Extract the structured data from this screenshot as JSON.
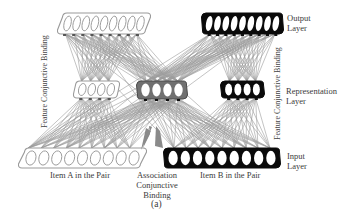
{
  "figure": {
    "caption": "(a)",
    "layers": {
      "output": {
        "label_line1": "Output",
        "label_line2": "Layer"
      },
      "representation": {
        "label_line1": "Representation",
        "label_line2": "Layer"
      },
      "input": {
        "label_line1": "Input",
        "label_line2": "Layer"
      }
    },
    "side_labels": {
      "left": "Feature Conjunctive Binding",
      "right": "Feature Conjunctive Binding"
    },
    "item_labels": {
      "item_a": "Item A in the Pair",
      "item_b": "Item B in the Pair"
    },
    "association_label": {
      "line1": "Association",
      "line2": "Conjunctive",
      "line3": "Binding"
    },
    "groups": [
      {
        "name": "output-a",
        "units": 9,
        "style": "light"
      },
      {
        "name": "output-b",
        "units": 9,
        "style": "dark"
      },
      {
        "name": "rep-a",
        "units": 4,
        "style": "light"
      },
      {
        "name": "rep-assoc",
        "units": 4,
        "style": "gray"
      },
      {
        "name": "rep-b",
        "units": 4,
        "style": "dark"
      },
      {
        "name": "input-a",
        "units": 9,
        "style": "light"
      },
      {
        "name": "input-b",
        "units": 9,
        "style": "dark"
      }
    ],
    "colors": {
      "light": "#9a9a9a",
      "gray": "#707070",
      "dark": "#0a0a0a",
      "line": "#8a8a8a"
    }
  }
}
